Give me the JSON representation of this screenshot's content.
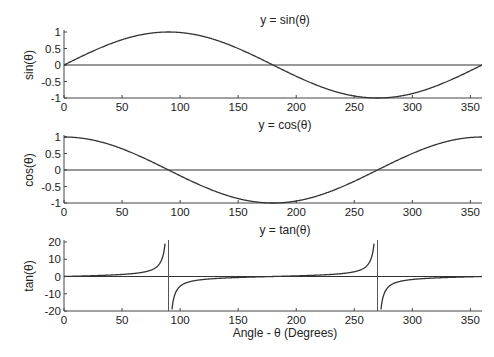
{
  "chart_data": [
    {
      "type": "line",
      "title": "y = sin(θ)",
      "xlabel": "",
      "ylabel": "sin(θ)",
      "xlim": [
        0,
        360
      ],
      "ylim": [
        -1,
        1
      ],
      "xticks": [
        0,
        50,
        100,
        150,
        200,
        250,
        300,
        350
      ],
      "yticks": [
        1,
        0.5,
        0,
        -0.5,
        -1
      ],
      "ytick_labels": [
        "1",
        "0.5",
        "0",
        "-0.5",
        "-1"
      ],
      "grid": false,
      "series": [
        {
          "name": "sin",
          "function": "sin",
          "x": [
            0,
            45,
            90,
            135,
            180,
            225,
            270,
            315,
            360
          ],
          "values": [
            0,
            0.707,
            1,
            0.707,
            0,
            -0.707,
            -1,
            -0.707,
            0
          ]
        }
      ],
      "reference_line": {
        "y": 0
      }
    },
    {
      "type": "line",
      "title": "y = cos(θ)",
      "xlabel": "",
      "ylabel": "cos(θ)",
      "xlim": [
        0,
        360
      ],
      "ylim": [
        -1,
        1
      ],
      "xticks": [
        0,
        50,
        100,
        150,
        200,
        250,
        300,
        350
      ],
      "yticks": [
        1,
        0.5,
        0,
        -0.5,
        -1
      ],
      "ytick_labels": [
        "1",
        "0.5",
        "0",
        "-0.5",
        "-1"
      ],
      "grid": false,
      "series": [
        {
          "name": "cos",
          "function": "cos",
          "x": [
            0,
            45,
            90,
            135,
            180,
            225,
            270,
            315,
            360
          ],
          "values": [
            1,
            0.707,
            0,
            -0.707,
            -1,
            -0.707,
            0,
            0.707,
            1
          ]
        }
      ],
      "reference_line": {
        "y": 0
      }
    },
    {
      "type": "line",
      "title": "y = tan(θ)",
      "xlabel": "Angle - θ (Degrees)",
      "ylabel": "tan(θ)",
      "xlim": [
        0,
        360
      ],
      "ylim": [
        -20,
        20
      ],
      "xticks": [
        0,
        50,
        100,
        150,
        200,
        250,
        300,
        350
      ],
      "yticks": [
        20,
        10,
        0,
        -10,
        -20
      ],
      "ytick_labels": [
        "20",
        "10",
        "0",
        "-10",
        "-20"
      ],
      "grid": false,
      "series": [
        {
          "name": "tan",
          "function": "tan",
          "x": [
            0,
            45,
            80,
            87,
            93,
            100,
            135,
            180,
            225,
            260,
            267,
            273,
            280,
            315,
            360
          ],
          "values": [
            0,
            1,
            5.67,
            19.08,
            -19.08,
            -5.67,
            -1,
            0,
            1,
            5.67,
            19.08,
            -19.08,
            -5.67,
            -1,
            0
          ]
        }
      ],
      "asymptotes": [
        90,
        270
      ],
      "reference_line": {
        "y": 0
      }
    }
  ],
  "line_color": "#333333"
}
